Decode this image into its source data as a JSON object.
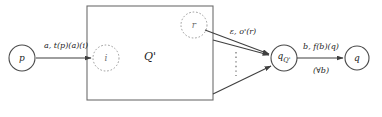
{
  "figure": {
    "colors": {
      "stroke": "#4a4a4a",
      "dashed_stroke": "#8c8c8c",
      "text": "#1d1d1d",
      "background": "#ffffff"
    }
  },
  "nodes": [
    {
      "id": "p",
      "label": "p",
      "sub": "",
      "style": "solid",
      "cx": 22,
      "cy": 58,
      "r": 13
    },
    {
      "id": "i",
      "label": "i",
      "sub": "",
      "style": "dashed",
      "cx": 106,
      "cy": 58,
      "r": 13
    },
    {
      "id": "r",
      "label": "r",
      "sub": "",
      "style": "dashed",
      "cx": 194,
      "cy": 25,
      "r": 13
    },
    {
      "id": "qQ",
      "label": "q",
      "sub": "Q'",
      "style": "solid",
      "cx": 284,
      "cy": 58,
      "r": 13
    },
    {
      "id": "q",
      "label": "q",
      "sub": "",
      "style": "solid",
      "cx": 357,
      "cy": 58,
      "r": 12
    }
  ],
  "region": {
    "label": "Q'",
    "x": 87,
    "y": 6,
    "width": 126,
    "height": 94,
    "label_x": 150,
    "label_y": 56
  },
  "edges": [
    {
      "id": "p-to-i",
      "from": "p",
      "to": "i",
      "label": "a, t(p)(a)(i)",
      "sublabel": "",
      "label_x": 66,
      "label_y": 46
    },
    {
      "id": "r-to-qQ",
      "from": "r",
      "to": "qQ",
      "label": "ε, o'(r)",
      "sublabel": "",
      "label_x": 243,
      "label_y": 32
    },
    {
      "id": "box-mid-to-qQ",
      "from": "region",
      "to": "qQ",
      "label": "",
      "sublabel": "",
      "label_x": 0,
      "label_y": 0
    },
    {
      "id": "box-bottom-to-qQ",
      "from": "region",
      "to": "qQ",
      "label": "",
      "sublabel": "",
      "label_x": 0,
      "label_y": 0
    },
    {
      "id": "qQ-to-q",
      "from": "qQ",
      "to": "q",
      "label": "b, f(b)(q)",
      "sublabel": "(∀b)",
      "label_x": 321,
      "label_y": 47
    }
  ],
  "ellipsis": {
    "name": "vertical-dots",
    "x": 236,
    "y_start": 52,
    "y_end": 76
  }
}
